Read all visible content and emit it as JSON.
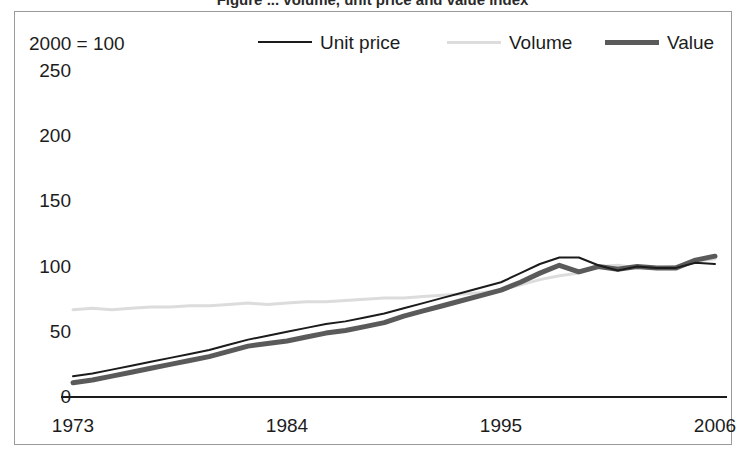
{
  "figure": {
    "clipped_title": "Figure ... volume, unit price and value index",
    "index_note": "2000 = 100"
  },
  "legend": {
    "entries": [
      {
        "label": "Unit price",
        "color": "#1b1b1b",
        "width": 2,
        "icon": "line-swatch-icon"
      },
      {
        "label": "Volume",
        "color": "#dcdcdc",
        "width": 3,
        "icon": "line-swatch-icon"
      },
      {
        "label": "Value",
        "color": "#5a5a5a",
        "width": 5,
        "icon": "line-swatch-icon"
      }
    ]
  },
  "axes": {
    "y_ticks": [
      "250",
      "200",
      "150",
      "100",
      "50",
      "0"
    ],
    "x_ticks": [
      "1973",
      "1984",
      "1995",
      "2006"
    ]
  },
  "chart_data": {
    "type": "line",
    "title": "",
    "subtitle": "2000 = 100",
    "xlabel": "",
    "ylabel": "",
    "xlim": [
      1973,
      2006
    ],
    "ylim": [
      0,
      250
    ],
    "ytick_values": [
      0,
      50,
      100,
      150,
      200,
      250
    ],
    "xtick_values": [
      1973,
      1984,
      1995,
      2006
    ],
    "grid": false,
    "legend_position": "top",
    "x": [
      1973,
      1974,
      1975,
      1976,
      1977,
      1978,
      1979,
      1980,
      1981,
      1982,
      1983,
      1984,
      1985,
      1986,
      1987,
      1988,
      1989,
      1990,
      1991,
      1992,
      1993,
      1994,
      1995,
      1996,
      1997,
      1998,
      1999,
      2000,
      2001,
      2002,
      2003,
      2004,
      2005,
      2006
    ],
    "series": [
      {
        "name": "Unit price",
        "color": "#1b1b1b",
        "width": 2,
        "values": [
          16,
          18,
          21,
          24,
          27,
          30,
          33,
          36,
          40,
          44,
          47,
          50,
          53,
          56,
          58,
          61,
          64,
          68,
          72,
          76,
          80,
          84,
          88,
          95,
          102,
          107,
          107,
          101,
          97,
          100,
          99,
          99,
          103,
          102
        ]
      },
      {
        "name": "Volume",
        "color": "#dcdcdc",
        "width": 3,
        "values": [
          67,
          68,
          67,
          68,
          69,
          69,
          70,
          70,
          71,
          72,
          71,
          72,
          73,
          73,
          74,
          75,
          76,
          76,
          77,
          78,
          79,
          80,
          82,
          86,
          90,
          93,
          95,
          100,
          101,
          99,
          99,
          100,
          104,
          106
        ]
      },
      {
        "name": "Value",
        "color": "#5a5a5a",
        "width": 5,
        "values": [
          11,
          13,
          16,
          19,
          22,
          25,
          28,
          31,
          35,
          39,
          41,
          43,
          46,
          49,
          51,
          54,
          57,
          62,
          66,
          70,
          74,
          78,
          82,
          88,
          95,
          101,
          96,
          100,
          98,
          100,
          99,
          99,
          105,
          108
        ]
      }
    ]
  }
}
